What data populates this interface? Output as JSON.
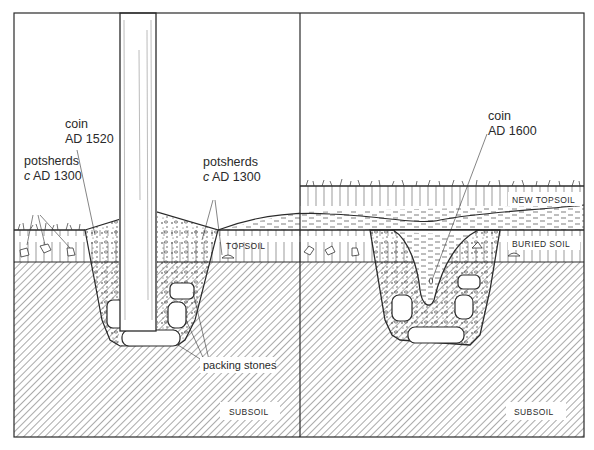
{
  "figure": {
    "type": "archaeological section diagram",
    "panels": [
      {
        "id": "left",
        "title": "Post in post-hole",
        "labels": {
          "coin_line1": "coin",
          "coin_line2": "AD 1520",
          "potsherds_left_line1": "potsherds",
          "potsherds_left_line2_c": "c",
          "potsherds_left_line2": " AD 1300",
          "potsherds_right_line1": "potsherds",
          "potsherds_right_line2_c": "c",
          "potsherds_right_line2": " AD 1300",
          "topsoil": "TOPSOIL",
          "packing_stones": "packing stones",
          "subsoil": "SUBSOIL"
        }
      },
      {
        "id": "right",
        "title": "Post-hole after post removed",
        "labels": {
          "coin_line1": "coin",
          "coin_line2": "AD 1600",
          "new_topsoil": "NEW TOPSOIL",
          "buried_soil": "BURIED SOIL",
          "subsoil": "SUBSOIL"
        }
      }
    ],
    "colors": {
      "ink": "#2a2a2a",
      "background": "#ffffff",
      "hatch": "#555555"
    }
  }
}
